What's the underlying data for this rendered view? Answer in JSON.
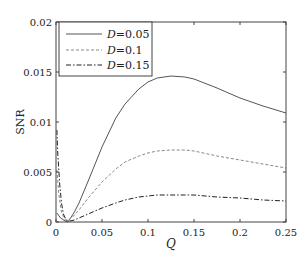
{
  "chart_data": {
    "type": "line",
    "title": "",
    "xlabel": "Q",
    "ylabel": "SNR",
    "xlim": [
      0,
      0.25
    ],
    "ylim": [
      0,
      0.02
    ],
    "xticks": [
      0,
      0.05,
      0.1,
      0.15,
      0.2,
      0.25
    ],
    "xtick_labels": [
      "0",
      "0.05",
      "0.1",
      "0.15",
      "0.2",
      "0.25"
    ],
    "yticks": [
      0,
      0.005,
      0.01,
      0.015,
      0.02
    ],
    "ytick_labels": [
      "0",
      "0.005",
      "0.01",
      "0.015",
      "0.02"
    ],
    "grid": false,
    "legend_position": "upper left",
    "series": [
      {
        "name": "D=0.05",
        "legend_var": "D",
        "legend_value": "=0.05",
        "style": "solid",
        "color": "#555555",
        "x": [
          0.001,
          0.005,
          0.01,
          0.013,
          0.02,
          0.025,
          0.035,
          0.05,
          0.065,
          0.075,
          0.09,
          0.1,
          0.11,
          0.125,
          0.14,
          0.15,
          0.175,
          0.2,
          0.225,
          0.25
        ],
        "y": [
          0.0009,
          0.0004,
          0.0001,
          0.0,
          0.001,
          0.0019,
          0.0041,
          0.0075,
          0.0104,
          0.0118,
          0.0133,
          0.014,
          0.0144,
          0.0146,
          0.0145,
          0.0143,
          0.0134,
          0.0124,
          0.0116,
          0.0109
        ]
      },
      {
        "name": "D=0.1",
        "legend_var": "D",
        "legend_value": "=0.1",
        "style": "dashed",
        "color": "#888888",
        "x": [
          0.001,
          0.003,
          0.006,
          0.009,
          0.012,
          0.018,
          0.025,
          0.035,
          0.05,
          0.065,
          0.075,
          0.09,
          0.1,
          0.11,
          0.125,
          0.14,
          0.15,
          0.175,
          0.2,
          0.225,
          0.25
        ],
        "y": [
          0.0052,
          0.0028,
          0.001,
          0.0003,
          0.0001,
          0.0005,
          0.0012,
          0.0024,
          0.004,
          0.0053,
          0.006,
          0.0066,
          0.0069,
          0.0071,
          0.0072,
          0.0072,
          0.0071,
          0.0066,
          0.0062,
          0.0058,
          0.0054
        ]
      },
      {
        "name": "D=0.15",
        "legend_var": "D",
        "legend_value": "=0.15",
        "style": "dashdot",
        "color": "#222222",
        "x": [
          0.001,
          0.002,
          0.004,
          0.006,
          0.008,
          0.011,
          0.015,
          0.02,
          0.025,
          0.035,
          0.05,
          0.065,
          0.075,
          0.09,
          0.1,
          0.11,
          0.125,
          0.14,
          0.15,
          0.175,
          0.2,
          0.225,
          0.25
        ],
        "y": [
          0.0092,
          0.0068,
          0.0038,
          0.0019,
          0.0008,
          0.0002,
          0.0001,
          0.0002,
          0.0004,
          0.0008,
          0.0014,
          0.0019,
          0.0022,
          0.0025,
          0.0026,
          0.0027,
          0.0027,
          0.0027,
          0.0027,
          0.0025,
          0.0024,
          0.0022,
          0.0021
        ]
      }
    ]
  }
}
